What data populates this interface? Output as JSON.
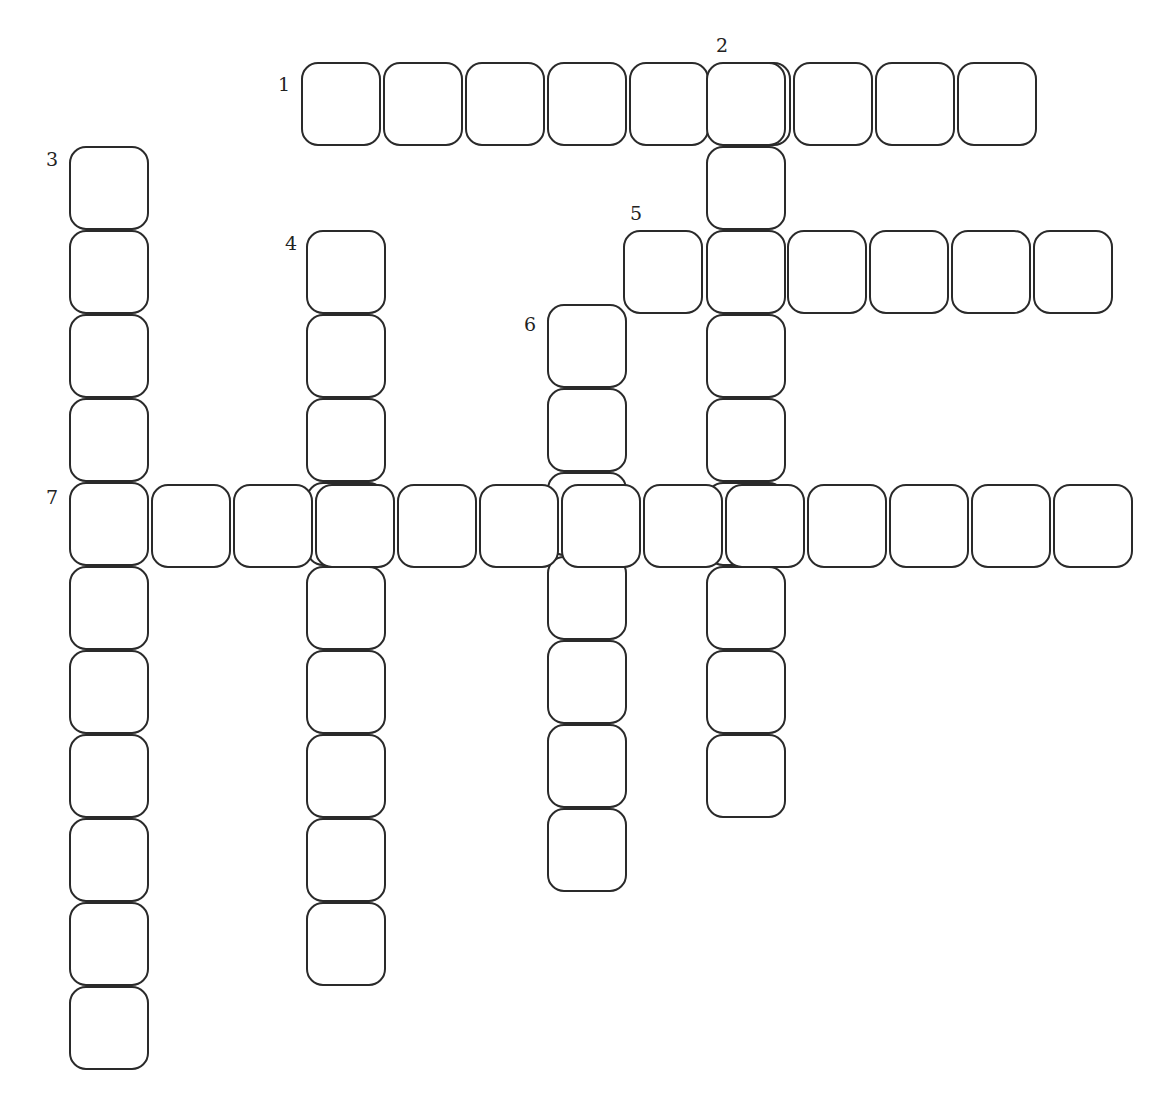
{
  "puzzle": {
    "type": "crossword",
    "cell_pitch_x": 82,
    "cell_pitch_y": 84,
    "entries": [
      {
        "number": "1",
        "direction": "across",
        "length": 9,
        "start": {
          "x": 301,
          "y": 62
        },
        "label_pos": {
          "x": 278,
          "y": 75
        }
      },
      {
        "number": "2",
        "direction": "down",
        "length": 9,
        "start": {
          "x": 706,
          "y": 62
        },
        "label_pos": {
          "x": 716,
          "y": 36
        }
      },
      {
        "number": "3",
        "direction": "down",
        "length": 11,
        "start": {
          "x": 69,
          "y": 146
        },
        "label_pos": {
          "x": 46,
          "y": 150
        }
      },
      {
        "number": "4",
        "direction": "down",
        "length": 9,
        "start": {
          "x": 306,
          "y": 230
        },
        "label_pos": {
          "x": 285,
          "y": 234
        }
      },
      {
        "number": "5",
        "direction": "across",
        "length": 6,
        "start": {
          "x": 623,
          "y": 230
        },
        "label_pos": {
          "x": 630,
          "y": 204
        }
      },
      {
        "number": "6",
        "direction": "down",
        "length": 7,
        "start": {
          "x": 547,
          "y": 304
        },
        "label_pos": {
          "x": 524,
          "y": 315
        }
      },
      {
        "number": "7",
        "direction": "across",
        "length": 13,
        "start": {
          "x": 69,
          "y": 484
        },
        "label_pos": {
          "x": 46,
          "y": 488
        }
      }
    ]
  }
}
